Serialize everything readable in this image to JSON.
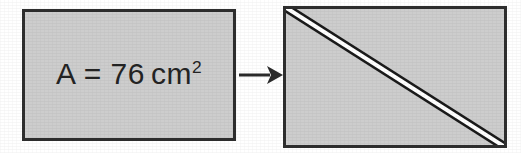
{
  "figure": {
    "background_color": "#ffffff",
    "sheet_fill_color": "#cdcdcd",
    "sheet_border_color": "#2e2e2e",
    "cut_line_color": "#1a1a1a",
    "cut_gap_color": "#ffffff"
  },
  "before": {
    "shape_name": "rectangle",
    "label_full": "A = 76 cm2",
    "label_variable": "A",
    "label_equals": "=",
    "label_value": "76",
    "label_unit": "cm",
    "label_exponent": "2"
  },
  "arrow": {
    "direction": "right",
    "icon": "arrow-right-icon"
  },
  "after": {
    "shape_name": "rectangle",
    "cut_description": "diagonal cut from top-left corner to bottom-right corner"
  }
}
